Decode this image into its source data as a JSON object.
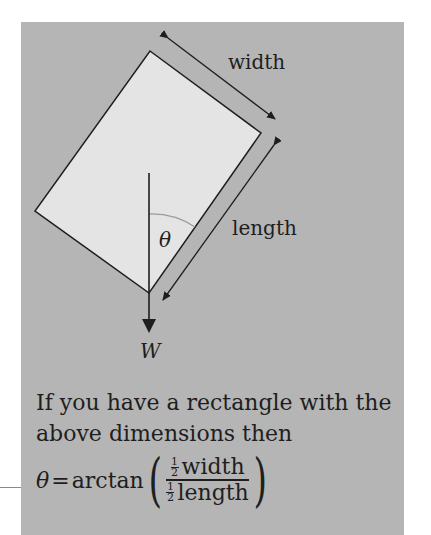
{
  "diagram": {
    "labels": {
      "width": "width",
      "length": "length",
      "theta": "θ",
      "weight": "W"
    },
    "colors": {
      "panel_background": "#b5b5b5",
      "rectangle_fill": "#e4e4e4",
      "stroke": "#1e1e1e",
      "angle_arc": "#9a9a9a"
    }
  },
  "caption": {
    "text": "If you have a rectangle with the above dimensions then"
  },
  "formula": {
    "lhs": "θ",
    "equals": "=",
    "function": "arctan",
    "half_num": "1",
    "half_den": "2",
    "numerator_var": "width",
    "denominator_var": "length"
  }
}
